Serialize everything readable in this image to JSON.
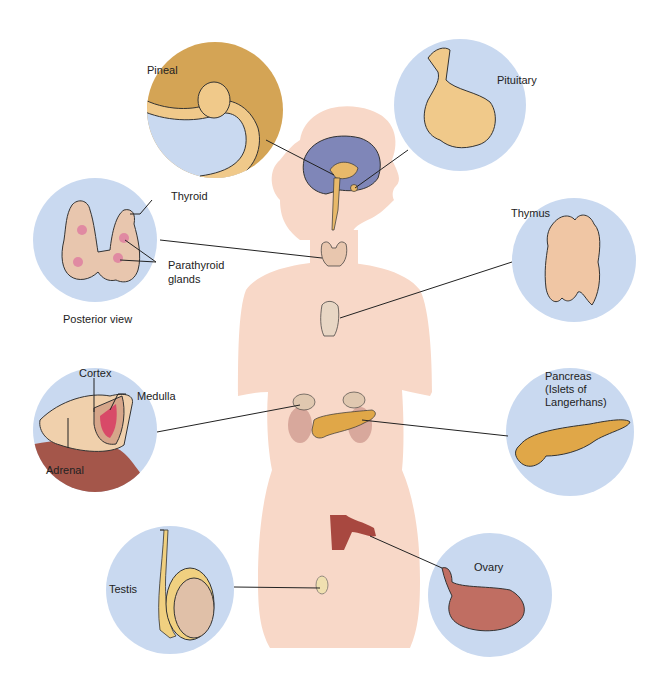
{
  "figure": {
    "colors": {
      "circle_bg": "#c9d9f0",
      "body_silhouette": "#f8d8c8",
      "gland_tan": "#e8b96a",
      "brain_purple": "#7f86b8",
      "thyroid_pink": "#e8c6ae",
      "pancreas_orange": "#e0a748",
      "ovary_red": "#b8665c",
      "uterus_red": "#a84840",
      "leader_line": "#222222"
    },
    "labels": {
      "pineal": "Pineal",
      "pituitary": "Pituitary",
      "thyroid": "Thyroid",
      "parathyroid_line1": "Parathyroid",
      "parathyroid_line2": "glands",
      "posterior_view": "Posterior view",
      "thymus": "Thymus",
      "cortex": "Cortex",
      "medulla": "Medulla",
      "adrenal": "Adrenal",
      "pancreas_line1": "Pancreas",
      "pancreas_line2": "(Islets of",
      "pancreas_line3": "Langerhans)",
      "testis": "Testis",
      "ovary": "Ovary"
    }
  }
}
